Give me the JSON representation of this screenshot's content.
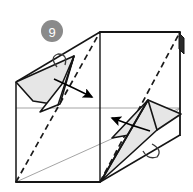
{
  "figure": {
    "step_number": "9",
    "kind": "diagram",
    "width": 193,
    "height": 192,
    "background_color": "#ffffff"
  },
  "badge": {
    "label": "9",
    "fill_color": "#8a8a8a",
    "text_color": "#ffffff",
    "center_x": 52,
    "center_y": 31,
    "radius": 11
  },
  "palette": {
    "outline": "#1a1a1a",
    "thin_line": "#8c8c8c",
    "shade_fill": "#e6e6e6",
    "shade_stroke": "#1a1a1a",
    "dashed": "#1a1a1a",
    "arrow": "#000000",
    "paper_white": "#ffffff"
  },
  "geometry": {
    "box_front": {
      "name": "front-panel",
      "points": "16,82 100,32 180,32 180,135 100,182 16,182"
    },
    "front_face": {
      "name": "front-face-square",
      "points": "16,82 100,32 100,182 16,182"
    },
    "right_face": {
      "name": "right-face-square",
      "points": "100,32 180,32 180,135 100,182"
    },
    "center_horizontal_line": {
      "name": "horizontal-crease",
      "x1": 16,
      "y1": 108,
      "x2": 180,
      "y2": 108
    },
    "center_vertical_line": {
      "name": "vertical-crease",
      "x1": 100,
      "y1": 32,
      "x2": 100,
      "y2": 182
    },
    "left_top_edge": {
      "x1": 16,
      "y1": 82,
      "x2": 100,
      "y2": 32
    },
    "left_vertical_edge": {
      "x1": 16,
      "y1": 82,
      "x2": 16,
      "y2": 182
    },
    "bottom_edge": {
      "x1": 16,
      "y1": 182,
      "x2": 100,
      "y2": 182
    },
    "top_edge": {
      "x1": 100,
      "y1": 32,
      "x2": 180,
      "y2": 32
    },
    "right_vertical_edge": {
      "x1": 180,
      "y1": 32,
      "x2": 180,
      "y2": 135
    },
    "right_bottom_edge": {
      "x1": 180,
      "y1": 135,
      "x2": 100,
      "y2": 182
    },
    "thin_diagonal_lower": {
      "x1": 16,
      "y1": 182,
      "x2": 180,
      "y2": 108
    },
    "thin_diagonal_right": {
      "x1": 100,
      "y1": 182,
      "x2": 180,
      "y2": 108
    },
    "dashed_left_diagonal": {
      "x1": 16,
      "y1": 182,
      "x2": 100,
      "y2": 32
    },
    "dashed_right_diagonal": {
      "x1": 100,
      "y1": 182,
      "x2": 180,
      "y2": 32
    },
    "left_flap": {
      "name": "left-shaded-flap",
      "points": "16,82 72,57 57,104 33,100"
    },
    "left_flap_inner": {
      "name": "left-flap-inner-panel",
      "points": "72,57 57,104 40,112 62,86"
    },
    "right_flap": {
      "name": "right-shaded-flap",
      "points": "180,114 148,100 113,138 157,129"
    },
    "right_flap_lower": {
      "name": "right-flap-lower-panel",
      "points": "101,182 148,100 157,129 133,150"
    },
    "arrow_upper": {
      "name": "fold-arrow-upper",
      "path": "M 55,80 Q 75,88 94,98",
      "tip_x": 99,
      "tip_y": 100,
      "angle": 28
    },
    "arrow_lower": {
      "name": "fold-arrow-lower",
      "path": "M 148,130 Q 128,124 110,118",
      "tip_x": 104,
      "tip_y": 116,
      "angle": 198
    },
    "curl_left": {
      "name": "left-curl-tab",
      "path": "M 58,66 Q 52,56 60,55 Q 68,55 66,64"
    },
    "curl_right": {
      "name": "right-curl-tab",
      "path": "M 152,146 Q 162,152 156,158 Q 148,161 144,152"
    },
    "top_right_tab": {
      "name": "top-right-tab",
      "path": "M 180,32 L 184,36 L 184,52 L 180,48 Z"
    }
  },
  "labels": {
    "step_caption": "9"
  }
}
